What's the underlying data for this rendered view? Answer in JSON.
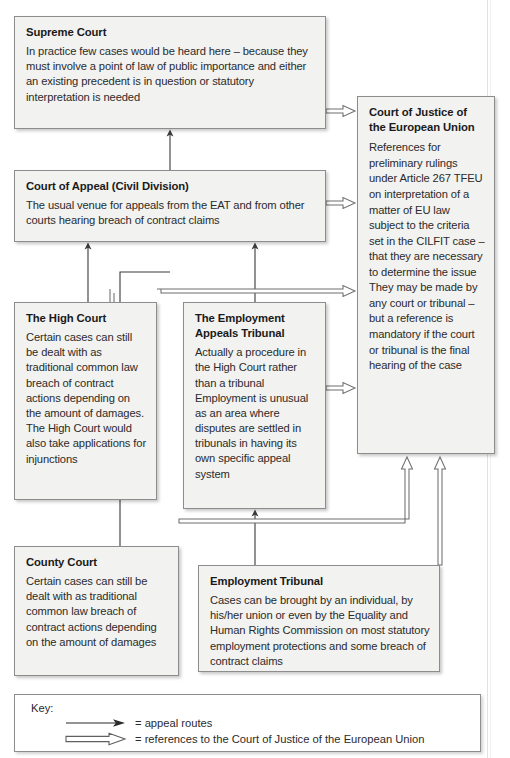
{
  "diagram": {
    "stroke_color": "#3a3a3a",
    "node_fill": "#f2f2f0",
    "node_border": "#8d8d8d"
  },
  "nodes": {
    "supreme": {
      "title": "Supreme Court",
      "body": "In practice few cases would be heard here – because they must involve a point of law of public importance and either an existing precedent is in question or statutory interpretation is needed"
    },
    "appeal": {
      "title": "Court of Appeal (Civil Division)",
      "body": "The usual venue for appeals from the EAT and from other courts hearing breach of contract claims"
    },
    "cjeu": {
      "title": "Court of Justice of the European Union",
      "body": "References for preliminary rulings under Article 267 TFEU on interpretation of a matter of EU law subject to the criteria set in the CILFIT case – that they are necessary to determine the issue They may be made by any court or tribunal – but a reference is mandatory if the court or tribunal is the final hearing of the case"
    },
    "high_court": {
      "title": "The High Court",
      "body": "Certain cases can still be dealt with as traditional common law breach of contract actions depending on the amount of damages. The High Court would also take applications for injunctions"
    },
    "eat": {
      "title": "The Employment Appeals Tribunal",
      "body": "Actually a procedure in the High Court rather than a tribunal Employment is unusual as an area where disputes are settled in tribunals in having its own specific appeal system"
    },
    "county_court": {
      "title": "County Court",
      "body": "Certain cases can still be dealt with as traditional common law breach of contract actions depending on the amount of damages"
    },
    "employment_tribunal": {
      "title": "Employment Tribunal",
      "body": "Cases can be brought by an individual, by his/her union or even by the Equality and Human Rights Commission on most statutory employment protections and some breach of contract claims"
    }
  },
  "key": {
    "heading": "Key:",
    "entries": [
      {
        "glyph": "solid-arrow-icon",
        "label": "= appeal routes"
      },
      {
        "glyph": "hollow-arrow-icon",
        "label": "= references to the Court of Justice of the European Union"
      }
    ]
  },
  "edges": [
    {
      "from": "county_court",
      "to": "appeal",
      "style": "solid"
    },
    {
      "from": "high_court",
      "to": "appeal",
      "style": "solid"
    },
    {
      "from": "eat",
      "to": "appeal",
      "style": "solid"
    },
    {
      "from": "employment_tribunal",
      "to": "eat",
      "style": "solid"
    },
    {
      "from": "appeal",
      "to": "supreme",
      "style": "solid"
    },
    {
      "from": "supreme",
      "to": "cjeu",
      "style": "hollow"
    },
    {
      "from": "appeal",
      "to": "cjeu",
      "style": "hollow"
    },
    {
      "from": "high_court",
      "to": "cjeu",
      "style": "hollow"
    },
    {
      "from": "eat",
      "to": "cjeu",
      "style": "hollow"
    },
    {
      "from": "county_court",
      "to": "cjeu",
      "style": "hollow"
    },
    {
      "from": "employment_tribunal",
      "to": "cjeu",
      "style": "hollow"
    }
  ]
}
